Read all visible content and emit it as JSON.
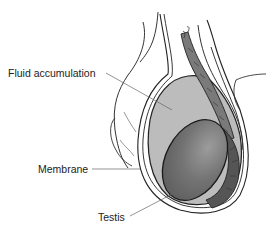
{
  "diagram": {
    "labels": [
      {
        "id": "fluid",
        "text": "Fluid accumulation",
        "x": 8,
        "y": 67
      },
      {
        "id": "membrane",
        "text": "Membrane",
        "x": 38,
        "y": 163
      },
      {
        "id": "testis",
        "text": "Testis",
        "x": 98,
        "y": 211
      }
    ],
    "colors": {
      "background": "#ffffff",
      "fluid": "#bcbcbc",
      "testis": "#6f6f6f",
      "testis_highlight": "#9a9a9a",
      "epididymis": "#555555",
      "spermatic_cord": "#7a7a7a",
      "outline": "#222222",
      "leader_line": "#666666"
    }
  }
}
